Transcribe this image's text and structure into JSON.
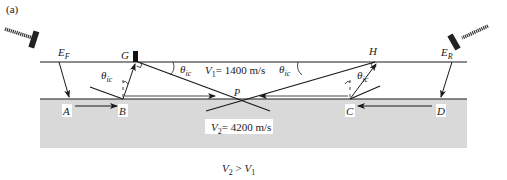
{
  "figure": {
    "panel_label": "(a)",
    "layer1": {
      "label_prefix": "V",
      "label_sub": "1",
      "label_value": "= 1400 m/s"
    },
    "layer2": {
      "label_prefix": "V",
      "label_sub": "2",
      "label_value": "= 4200 m/s"
    },
    "condition": {
      "a": "V",
      "a_sub": "2",
      "op": " > ",
      "b": "V",
      "b_sub": "1"
    },
    "sources": {
      "forward": {
        "label": "E",
        "sub": "F"
      },
      "reverse": {
        "label": "E",
        "sub": "R"
      }
    },
    "points": {
      "A": "A",
      "B": "B",
      "C": "C",
      "D": "D",
      "G": "G",
      "H": "H",
      "P": "P"
    },
    "angle": {
      "symbol": "θ",
      "sub": "ic"
    },
    "colors": {
      "line": "#1a1a1a",
      "layer2_fill": "#d9d9d9",
      "hammer": "#222222"
    }
  }
}
